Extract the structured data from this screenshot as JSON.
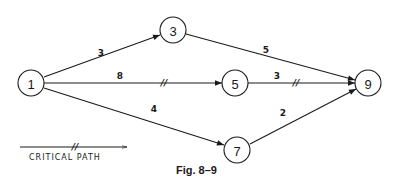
{
  "figure": {
    "caption": "Fig. 8–9",
    "legend": {
      "label": "CRITICAL PATH",
      "marker": "//"
    }
  },
  "nodes": [
    {
      "id": "1",
      "label": "1",
      "x": 31,
      "y": 83
    },
    {
      "id": "3",
      "label": "3",
      "x": 173,
      "y": 30
    },
    {
      "id": "5",
      "label": "5",
      "x": 235,
      "y": 83
    },
    {
      "id": "7",
      "label": "7",
      "x": 237,
      "y": 150
    },
    {
      "id": "9",
      "label": "9",
      "x": 368,
      "y": 83
    }
  ],
  "edges": [
    {
      "from": "1",
      "to": "3",
      "weight": "3",
      "critical": false
    },
    {
      "from": "1",
      "to": "5",
      "weight": "8",
      "critical": true
    },
    {
      "from": "1",
      "to": "7",
      "weight": "4",
      "critical": false
    },
    {
      "from": "3",
      "to": "9",
      "weight": "5",
      "critical": false
    },
    {
      "from": "5",
      "to": "9",
      "weight": "3",
      "critical": true
    },
    {
      "from": "7",
      "to": "9",
      "weight": "2",
      "critical": false
    }
  ],
  "colors": {
    "ink": "#1a1a1a",
    "background": "#ffffff"
  }
}
